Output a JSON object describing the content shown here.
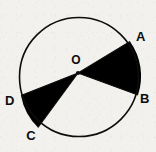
{
  "figure": {
    "kind": "geometry-diagram",
    "canvas": {
      "width": 156,
      "height": 152
    },
    "background_color": "#f2f1ed",
    "ink_color": "#0d0d0d",
    "shade_color": "#000000"
  },
  "circle": {
    "center_x": 79,
    "center_y": 77,
    "radius": 59.5,
    "stroke_width": 1.6,
    "stroke_color": "#0d0d0d",
    "fill_color": "none"
  },
  "center_point": {
    "label": "O",
    "dot_x": 78,
    "dot_y": 73,
    "dot_radius": 2.1,
    "label_x": 76,
    "label_y": 64
  },
  "vertices": [
    {
      "id": "A",
      "label": "A",
      "px": 130.0,
      "py": 41.5,
      "label_x": 136,
      "label_y": 41
    },
    {
      "id": "B",
      "label": "B",
      "px": 138.0,
      "py": 95.0,
      "label_x": 140,
      "label_y": 103
    },
    {
      "id": "C",
      "label": "C",
      "px": 38.0,
      "py": 127.5,
      "label_x": 31,
      "label_y": 140
    },
    {
      "id": "D",
      "label": "D",
      "px": 21.0,
      "py": 95.5,
      "label_x": 5,
      "label_y": 105
    }
  ],
  "shaded_sectors": [
    {
      "name": "sector-AOB",
      "from_vertex": "A",
      "to_vertex": "B",
      "path": "M 78 73 L 130.0 41.5 A 59.5 59.5 0 0 1 138.0 95.0 Z",
      "fill": "#000000"
    },
    {
      "name": "sector-COD",
      "from_vertex": "C",
      "to_vertex": "D",
      "path": "M 78 73 L 21.0 95.5 A 59.5 59.5 0 0 0 38.0 127.5 Z",
      "fill": "#000000"
    }
  ],
  "radii_lines": [
    {
      "name": "radius-OA",
      "x1": 78,
      "y1": 73,
      "x2": 130.0,
      "y2": 41.5
    },
    {
      "name": "radius-OB",
      "x1": 78,
      "y1": 73,
      "x2": 138.0,
      "y2": 95.0
    },
    {
      "name": "radius-OC",
      "x1": 78,
      "y1": 73,
      "x2": 38.0,
      "y2": 127.5
    },
    {
      "name": "radius-OD",
      "x1": 78,
      "y1": 73,
      "x2": 21.0,
      "y2": 95.5
    }
  ]
}
